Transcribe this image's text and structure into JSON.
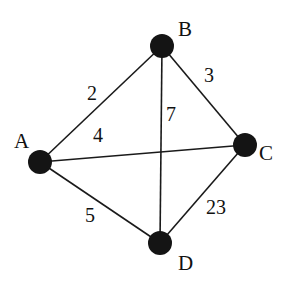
{
  "diagram": {
    "type": "weighted-undirected-graph",
    "nodes": [
      {
        "id": "A",
        "label": "A",
        "x": 40,
        "y": 162,
        "label_x": 14,
        "label_y": 148
      },
      {
        "id": "B",
        "label": "B",
        "x": 162,
        "y": 46,
        "label_x": 178,
        "label_y": 36
      },
      {
        "id": "C",
        "label": "C",
        "x": 245,
        "y": 145,
        "label_x": 259,
        "label_y": 160
      },
      {
        "id": "D",
        "label": "D",
        "x": 160,
        "y": 243,
        "label_x": 178,
        "label_y": 270
      }
    ],
    "edges": [
      {
        "from": "A",
        "to": "B",
        "weight": "2",
        "label_x": 87,
        "label_y": 100
      },
      {
        "from": "B",
        "to": "C",
        "weight": "3",
        "label_x": 204,
        "label_y": 82
      },
      {
        "from": "B",
        "to": "D",
        "weight": "7",
        "label_x": 166,
        "label_y": 121
      },
      {
        "from": "A",
        "to": "C",
        "weight": "4",
        "label_x": 93,
        "label_y": 142
      },
      {
        "from": "A",
        "to": "D",
        "weight": "5",
        "label_x": 85,
        "label_y": 222
      },
      {
        "from": "C",
        "to": "D",
        "weight": "23",
        "label_x": 206,
        "label_y": 214
      }
    ]
  }
}
